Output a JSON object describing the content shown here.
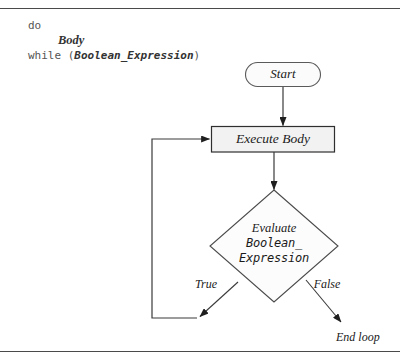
{
  "figure": {
    "background_color": "#ffffff",
    "rule_color": "#4a4a4a",
    "line_color": "#3a3a3a",
    "box_fill_color": "#f2f2f2",
    "text_color": "#1a1a1a",
    "code_color": "#555555"
  },
  "code": {
    "line1_keyword": "do",
    "line2_placeholder": "Body",
    "line3_keyword_open": "while (",
    "line3_placeholder": "Boolean_Expression",
    "line3_keyword_close": ")"
  },
  "nodes": {
    "start": {
      "label": "Start",
      "shape": "stadium"
    },
    "execute_body": {
      "label": "Execute Body",
      "shape": "rectangle"
    },
    "decision": {
      "shape": "diamond",
      "line1": "Evaluate",
      "line2": "Boolean_",
      "line3": "Expression"
    },
    "end_loop": {
      "label": "End loop",
      "shape": "text"
    }
  },
  "edges": {
    "true_label": "True",
    "false_label": "False"
  }
}
